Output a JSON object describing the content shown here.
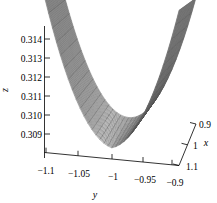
{
  "chart_data": {
    "type": "surface3d",
    "title": "",
    "xlabel": "x",
    "ylabel": "y",
    "zlabel": "z",
    "xticks": [
      "0.9",
      "1",
      "1.1"
    ],
    "yticks": [
      "−1.1",
      "−1.05",
      "−1",
      "−0.95",
      "−0.9"
    ],
    "zticks": [
      "0.314",
      "0.313",
      "0.312",
      "0.311",
      "0.310",
      "0.309"
    ],
    "xlim": [
      0.9,
      1.1
    ],
    "ylim": [
      -1.1,
      -0.9
    ],
    "zlim": [
      0.3085,
      0.3145
    ],
    "grid": false,
    "legend": null,
    "surface": {
      "shape": "parabolic-valley",
      "mesh_color": "#555555",
      "fill_color": "#9a9a9a",
      "description": "Smooth saddle/valley surface rising at left and right edges, minimum near y=-1"
    },
    "values": {
      "z_min": 0.3085,
      "z_max": 0.3145,
      "minimum_location": {
        "x": 1.0,
        "y": -1.0,
        "z": 0.3085
      }
    }
  },
  "axes": {
    "z": {
      "label": "z",
      "ticks": [
        {
          "label": "0.314",
          "y": 39
        },
        {
          "label": "0.313",
          "y": 58
        },
        {
          "label": "0.312",
          "y": 77
        },
        {
          "label": "0.311",
          "y": 96
        },
        {
          "label": "0.310",
          "y": 115
        },
        {
          "label": "0.309",
          "y": 134
        }
      ]
    },
    "y": {
      "label": "y",
      "ticks": [
        {
          "label": "−1.1",
          "x": 46
        },
        {
          "label": "−1.05",
          "x": 78
        },
        {
          "label": "−1",
          "x": 112
        },
        {
          "label": "−0.95",
          "x": 143
        },
        {
          "label": "−0.9",
          "x": 172
        }
      ]
    },
    "x": {
      "label": "x",
      "ticks": [
        {
          "label": "0.9"
        },
        {
          "label": "1"
        },
        {
          "label": "1.1"
        }
      ]
    }
  }
}
